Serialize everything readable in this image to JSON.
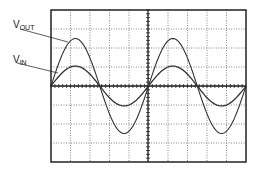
{
  "labels": {
    "vout_main": "V",
    "vout_sub": "OUT",
    "vin_main": "V",
    "vin_sub": "IN"
  },
  "grid": {
    "columns": 10,
    "rows": 8,
    "frame": {
      "left": 51,
      "top": 10,
      "right": 246,
      "bottom": 162
    },
    "center": {
      "x": 148,
      "y": 86
    }
  },
  "colors": {
    "frame": "#222222",
    "grid": "#555555",
    "trace": "#333333"
  },
  "chart_data": {
    "type": "line",
    "title": "",
    "xlabel": "",
    "ylabel": "",
    "grid": true,
    "series": [
      {
        "name": "VOUT",
        "amplitude_divisions": 2.5,
        "cycles": 2,
        "phase": "in phase"
      },
      {
        "name": "VIN",
        "amplitude_divisions": 1.05,
        "cycles": 2,
        "phase": "in phase"
      }
    ]
  }
}
